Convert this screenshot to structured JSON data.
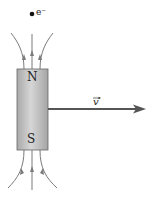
{
  "diagram": {
    "electron": {
      "label": "e⁻"
    },
    "magnet": {
      "north_label": "N",
      "south_label": "S",
      "fill": "#b5b5b5",
      "highlight": "#d8d8d8"
    },
    "velocity": {
      "label": "v",
      "color": "#555555"
    },
    "field_line_color": "#7a7a7a"
  }
}
